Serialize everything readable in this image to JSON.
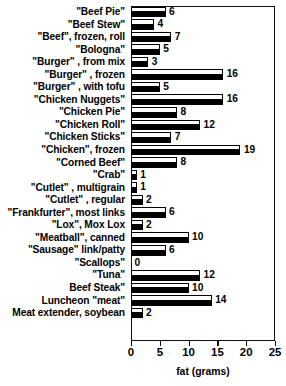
{
  "chart_data": {
    "type": "bar",
    "orientation": "horizontal",
    "title": "",
    "xlabel": "fat (grams)",
    "ylabel": "",
    "xlim": [
      0,
      25
    ],
    "xticks": [
      0,
      5,
      10,
      15,
      20,
      25
    ],
    "grid": false,
    "legend": null,
    "categories": [
      "\"Beef Pie\"",
      "\"Beef Stew\"",
      "\"Beef\", frozen, roll",
      "\"Bologna\"",
      "\"Burger\" , from mix",
      "\"Burger\" , frozen",
      "\"Burger\" , with tofu",
      "\"Chicken Nuggets\"",
      "\"Chicken Pie\"",
      "\"Chicken Roll\"",
      "\"Chicken Sticks\"",
      "\"Chicken\", frozen",
      "\"Corned Beef\"",
      "\"Crab\"",
      "\"Cutlet\" , multigrain",
      "\"Cutlet\" , regular",
      "\"Frankfurter\", most links",
      "\"Lox\", Mox Lox",
      "\"Meatball\", canned",
      "\"Sausage\" link/patty",
      "\"Scallops\"",
      "\"Tuna\"",
      "Beef Steak\"",
      "Luncheon \"meat\"",
      "Meat extender, soybean"
    ],
    "values": [
      6,
      4,
      7,
      5,
      3,
      16,
      5,
      16,
      8,
      12,
      7,
      19,
      8,
      1,
      1,
      2,
      6,
      2,
      10,
      6,
      0,
      12,
      10,
      14,
      2
    ],
    "value_labels": [
      "6",
      "4",
      "7",
      "5",
      "3",
      "16",
      "5",
      "16",
      "8",
      "12",
      "7",
      "19",
      "8",
      "1",
      "1",
      "2",
      "6",
      "2",
      "10",
      "6",
      "0",
      "12",
      "10",
      "14",
      "2"
    ],
    "tick_labels": [
      "0",
      "5",
      "10",
      "15",
      "20",
      "25"
    ],
    "colors": {
      "bar_fill": "#ffffff",
      "bar_outline": "#000000",
      "bar_shadow": "#000000",
      "frame": "#111111",
      "text": "#000000",
      "background": "#ffffff"
    }
  }
}
